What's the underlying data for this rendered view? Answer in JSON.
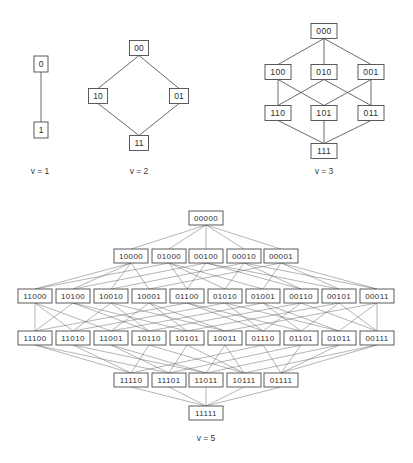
{
  "figure": {
    "background_color": "#ffffff",
    "box_fill_color": "#ffffff",
    "box_stroke_color": "#4a4a4a",
    "edge_color": "#5a5a5a",
    "text_color": "#2e2e2e"
  },
  "diagrams": [
    {
      "id": "v1",
      "caption": "v = 1",
      "caption_x": 40,
      "caption_y": 172,
      "bits": 1,
      "node_width": 14,
      "node_height": 16,
      "font_size": 8.5,
      "levels": [
        {
          "rank": 0,
          "y": 64,
          "nodes": [
            {
              "label": "0",
              "x": 41
            }
          ]
        },
        {
          "rank": 1,
          "y": 130,
          "nodes": [
            {
              "label": "1",
              "x": 41
            }
          ]
        }
      ],
      "edges": [
        [
          "0",
          "1"
        ]
      ]
    },
    {
      "id": "v2",
      "caption": "v = 2",
      "caption_x": 139,
      "caption_y": 172,
      "bits": 2,
      "node_width": 19,
      "node_height": 15,
      "font_size": 8.5,
      "levels": [
        {
          "rank": 0,
          "y": 48,
          "nodes": [
            {
              "label": "00",
              "x": 139
            }
          ]
        },
        {
          "rank": 1,
          "y": 96,
          "nodes": [
            {
              "label": "10",
              "x": 98
            },
            {
              "label": "01",
              "x": 179
            }
          ]
        },
        {
          "rank": 2,
          "y": 143,
          "nodes": [
            {
              "label": "11",
              "x": 139
            }
          ]
        }
      ],
      "edges": [
        [
          "00",
          "10"
        ],
        [
          "00",
          "01"
        ],
        [
          "10",
          "11"
        ],
        [
          "01",
          "11"
        ]
      ]
    },
    {
      "id": "v3",
      "caption": "v = 3",
      "caption_x": 324,
      "caption_y": 172,
      "bits": 3,
      "node_width": 26,
      "node_height": 15,
      "font_size": 8.5,
      "levels": [
        {
          "rank": 0,
          "y": 31,
          "nodes": [
            {
              "label": "000",
              "x": 324
            }
          ]
        },
        {
          "rank": 1,
          "y": 72,
          "nodes": [
            {
              "label": "100",
              "x": 278
            },
            {
              "label": "010",
              "x": 324
            },
            {
              "label": "001",
              "x": 371
            }
          ]
        },
        {
          "rank": 2,
          "y": 113,
          "nodes": [
            {
              "label": "110",
              "x": 278
            },
            {
              "label": "101",
              "x": 324
            },
            {
              "label": "011",
              "x": 371
            }
          ]
        },
        {
          "rank": 3,
          "y": 151,
          "nodes": [
            {
              "label": "111",
              "x": 324
            }
          ]
        }
      ],
      "edges": [
        [
          "000",
          "100"
        ],
        [
          "000",
          "010"
        ],
        [
          "000",
          "001"
        ],
        [
          "100",
          "110"
        ],
        [
          "100",
          "101"
        ],
        [
          "010",
          "110"
        ],
        [
          "010",
          "011"
        ],
        [
          "001",
          "101"
        ],
        [
          "001",
          "011"
        ],
        [
          "110",
          "111"
        ],
        [
          "101",
          "111"
        ],
        [
          "011",
          "111"
        ]
      ]
    },
    {
      "id": "v5",
      "caption": "v = 5",
      "caption_x": 206,
      "caption_y": 439,
      "bits": 5,
      "node_width": 34,
      "node_height": 14,
      "font_size": 8,
      "levels": [
        {
          "rank": 0,
          "y": 218,
          "nodes": [
            {
              "label": "00000",
              "x": 206
            }
          ]
        },
        {
          "rank": 1,
          "y": 256,
          "nodes": [
            {
              "label": "10000",
              "x": 131
            },
            {
              "label": "01000",
              "x": 169
            },
            {
              "label": "00100",
              "x": 206
            },
            {
              "label": "00010",
              "x": 244
            },
            {
              "label": "00001",
              "x": 281
            }
          ]
        },
        {
          "rank": 2,
          "y": 296,
          "nodes": [
            {
              "label": "11000",
              "x": 35
            },
            {
              "label": "10100",
              "x": 73
            },
            {
              "label": "10010",
              "x": 111
            },
            {
              "label": "10001",
              "x": 149
            },
            {
              "label": "01100",
              "x": 187
            },
            {
              "label": "01010",
              "x": 225
            },
            {
              "label": "01001",
              "x": 263
            },
            {
              "label": "00110",
              "x": 301
            },
            {
              "label": "00101",
              "x": 339
            },
            {
              "label": "00011",
              "x": 377
            }
          ]
        },
        {
          "rank": 3,
          "y": 338,
          "nodes": [
            {
              "label": "11100",
              "x": 35
            },
            {
              "label": "11010",
              "x": 73
            },
            {
              "label": "11001",
              "x": 111
            },
            {
              "label": "10110",
              "x": 149
            },
            {
              "label": "10101",
              "x": 187
            },
            {
              "label": "10011",
              "x": 225
            },
            {
              "label": "01110",
              "x": 263
            },
            {
              "label": "01101",
              "x": 301
            },
            {
              "label": "01011",
              "x": 339
            },
            {
              "label": "00111",
              "x": 377
            }
          ]
        },
        {
          "rank": 4,
          "y": 380,
          "nodes": [
            {
              "label": "11110",
              "x": 131
            },
            {
              "label": "11101",
              "x": 169
            },
            {
              "label": "11011",
              "x": 206
            },
            {
              "label": "10111",
              "x": 244
            },
            {
              "label": "01111",
              "x": 281
            }
          ]
        },
        {
          "rank": 5,
          "y": 413,
          "nodes": [
            {
              "label": "11111",
              "x": 206
            }
          ]
        }
      ],
      "edges": "auto-hamming"
    }
  ],
  "captions": [
    {
      "name": "caption-v1",
      "text": "v = 1"
    },
    {
      "name": "caption-v2",
      "text": "v = 2"
    },
    {
      "name": "caption-v3",
      "text": "v = 3"
    },
    {
      "name": "caption-v5",
      "text": "v = 5"
    }
  ]
}
